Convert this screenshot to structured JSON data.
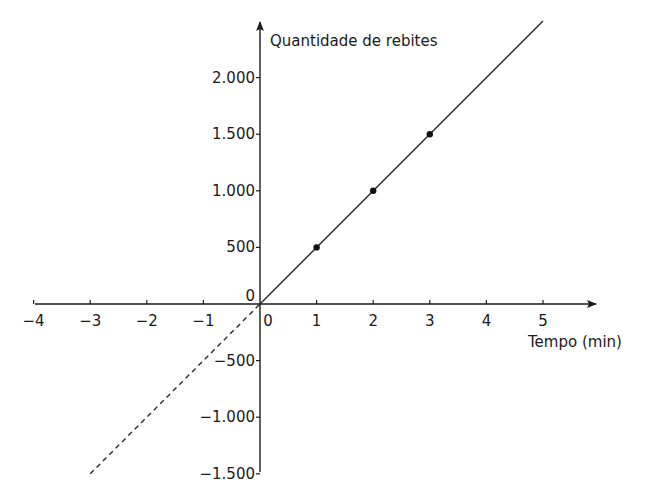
{
  "chart_data": {
    "type": "line",
    "title": "",
    "xlabel": "Tempo (min)",
    "ylabel": "Quantidade de rebites",
    "x_ticks": [
      -4,
      -3,
      -2,
      -1,
      0,
      1,
      2,
      3,
      4,
      5
    ],
    "x_tick_labels": [
      "−4",
      "−3",
      "−2",
      "−1",
      "0",
      "1",
      "2",
      "3",
      "4",
      "5"
    ],
    "y_ticks": [
      -1500,
      -1000,
      -500,
      0,
      500,
      1000,
      1500,
      2000
    ],
    "y_tick_labels": [
      "−1.500",
      "−1.000",
      "−500",
      "0",
      "500",
      "1.000",
      "1.500",
      "2.000"
    ],
    "xlim": [
      -4.2,
      6
    ],
    "ylim": [
      -1500,
      2500
    ],
    "grid": false,
    "series": [
      {
        "name": "solid line y = 500x",
        "style": "solid",
        "x": [
          0,
          5
        ],
        "values": [
          0,
          2500
        ]
      },
      {
        "name": "dashed extension y = 500x",
        "style": "dashed",
        "x": [
          -3,
          0
        ],
        "values": [
          -1500,
          0
        ]
      },
      {
        "name": "points",
        "style": "markers",
        "x": [
          1,
          2,
          3
        ],
        "values": [
          500,
          1000,
          1500
        ]
      }
    ],
    "origin_label": "0"
  },
  "axes": {
    "x_label": "Tempo (min)",
    "y_label": "Quantidade de rebites",
    "origin_label": "0"
  }
}
